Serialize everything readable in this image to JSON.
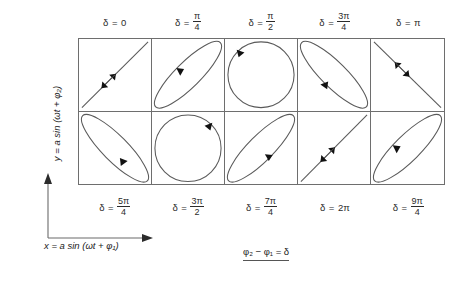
{
  "figure": {
    "type": "lissajous-phase-grid",
    "rows": 2,
    "columns": 5,
    "axes": {
      "x_label_prefix": "x = a sin (ωt + φ",
      "x_label_sub": "1",
      "x_label_suffix": ")",
      "x_label_full": "x = a sin (ωt + φ₁)",
      "y_label_prefix": "y = a sin (ωt + φ",
      "y_label_sub": "2",
      "y_label_suffix": ")",
      "y_label_full": "y = a sin (ωt + φ₂)",
      "x_direction": "right",
      "y_direction": "up"
    },
    "caption": {
      "text": "φ₂ − φ₁ = δ",
      "underlined": true
    },
    "top_labels": [
      {
        "delta": "δ",
        "eq": "=",
        "value": "0",
        "is_fraction": false
      },
      {
        "delta": "δ",
        "eq": "=",
        "value": "π/4",
        "is_fraction": true,
        "numerator": "π",
        "denominator": "4"
      },
      {
        "delta": "δ",
        "eq": "=",
        "value": "π/2",
        "is_fraction": true,
        "numerator": "π",
        "denominator": "2"
      },
      {
        "delta": "δ",
        "eq": "=",
        "value": "3π/4",
        "is_fraction": true,
        "numerator": "3π",
        "denominator": "4"
      },
      {
        "delta": "δ",
        "eq": "=",
        "value": "π",
        "is_fraction": false
      }
    ],
    "bottom_labels": [
      {
        "delta": "δ",
        "eq": "=",
        "value": "5π/4",
        "is_fraction": true,
        "numerator": "5π",
        "denominator": "4"
      },
      {
        "delta": "δ",
        "eq": "=",
        "value": "3π/2",
        "is_fraction": true,
        "numerator": "3π",
        "denominator": "2"
      },
      {
        "delta": "δ",
        "eq": "=",
        "value": "7π/4",
        "is_fraction": true,
        "numerator": "7π",
        "denominator": "4"
      },
      {
        "delta": "δ",
        "eq": "=",
        "value": "2π",
        "is_fraction": false
      },
      {
        "delta": "δ",
        "eq": "=",
        "value": "9π/4",
        "is_fraction": true,
        "numerator": "9π",
        "denominator": "4"
      }
    ],
    "cells": [
      {
        "index": 0,
        "row": 1,
        "col": 1,
        "delta": "0",
        "shape": "line",
        "orientation": "diagonal-up",
        "arrows": "double",
        "sense": "oscillating"
      },
      {
        "index": 1,
        "row": 1,
        "col": 2,
        "delta": "π/4",
        "shape": "ellipse-narrow",
        "orientation": "diagonal-up",
        "arrows": "single",
        "sense": "counterclockwise"
      },
      {
        "index": 2,
        "row": 1,
        "col": 3,
        "delta": "π/2",
        "shape": "circle",
        "orientation": "none",
        "arrows": "single",
        "sense": "counterclockwise"
      },
      {
        "index": 3,
        "row": 1,
        "col": 4,
        "delta": "3π/4",
        "shape": "ellipse-narrow",
        "orientation": "diagonal-down",
        "arrows": "single",
        "sense": "counterclockwise"
      },
      {
        "index": 4,
        "row": 1,
        "col": 5,
        "delta": "π",
        "shape": "line",
        "orientation": "diagonal-down",
        "arrows": "double",
        "sense": "oscillating"
      },
      {
        "index": 5,
        "row": 2,
        "col": 1,
        "delta": "5π/4",
        "shape": "ellipse-narrow",
        "orientation": "diagonal-down",
        "arrows": "single",
        "sense": "clockwise"
      },
      {
        "index": 6,
        "row": 2,
        "col": 2,
        "delta": "3π/2",
        "shape": "circle",
        "orientation": "none",
        "arrows": "single",
        "sense": "clockwise"
      },
      {
        "index": 7,
        "row": 2,
        "col": 3,
        "delta": "7π/4",
        "shape": "ellipse-narrow",
        "orientation": "diagonal-up",
        "arrows": "single",
        "sense": "clockwise"
      },
      {
        "index": 8,
        "row": 2,
        "col": 4,
        "delta": "2π",
        "shape": "line",
        "orientation": "diagonal-up",
        "arrows": "double",
        "sense": "oscillating"
      },
      {
        "index": 9,
        "row": 2,
        "col": 5,
        "delta": "9π/4",
        "shape": "ellipse-narrow",
        "orientation": "diagonal-up",
        "arrows": "single",
        "sense": "counterclockwise"
      }
    ],
    "colors": {
      "stroke": "#5a5a5a",
      "grid": "#6e6e6e",
      "text": "#222222",
      "arrow": "#111111",
      "background": "#ffffff"
    }
  }
}
